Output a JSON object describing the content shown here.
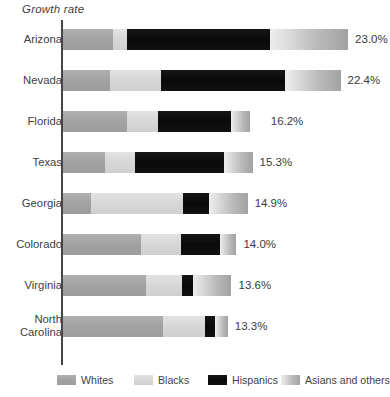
{
  "chart_data": {
    "type": "bar",
    "title": "Growth rate",
    "subtitle": "",
    "xlabel": "",
    "ylabel": "",
    "orientation": "horizontal",
    "stacked": true,
    "grid": false,
    "legend_position": "bottom",
    "axis_line": "left-vertical",
    "categories": [
      "Arizona",
      "Nevada",
      "Florida",
      "Texas",
      "Georgia",
      "Colorado",
      "Virginia",
      "North\nCarolina"
    ],
    "value_labels": [
      "23.0%",
      "22.4%",
      "16.2%",
      "15.3%",
      "14.9%",
      "14.0%",
      "13.6%",
      "13.3%"
    ],
    "totals": [
      23.0,
      22.4,
      16.2,
      15.3,
      14.9,
      14.0,
      13.6,
      13.3
    ],
    "series": [
      {
        "name": "Whites",
        "color": "#a3a3a3",
        "values": [
          4.0,
          3.8,
          5.2,
          3.4,
          2.3,
          6.3,
          6.7,
          8.1
        ]
      },
      {
        "name": "Blacks",
        "color": "#d7d7d7",
        "values": [
          1.2,
          4.1,
          2.5,
          2.4,
          7.4,
          3.2,
          2.9,
          3.4
        ]
      },
      {
        "name": "Hispanics",
        "color": "#0a0a0a",
        "values": [
          11.5,
          10.0,
          5.9,
          7.2,
          2.1,
          3.2,
          0.9,
          0.8
        ]
      },
      {
        "name": "Asians and others",
        "color": "#b9b9b9",
        "values": [
          6.3,
          4.5,
          1.5,
          2.3,
          3.1,
          1.3,
          3.1,
          1.0
        ]
      }
    ]
  },
  "legend": {
    "items": [
      {
        "label": "Whites"
      },
      {
        "label": "Blacks"
      },
      {
        "label": "Hispanics"
      },
      {
        "label": "Asians and others"
      }
    ]
  }
}
